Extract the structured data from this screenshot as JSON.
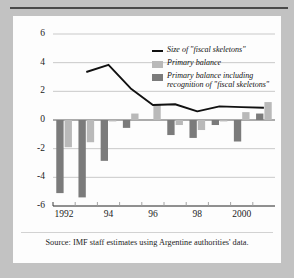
{
  "chart_data": {
    "type": "bar",
    "title": "",
    "subtitle": "",
    "xlabel": "",
    "ylabel": "",
    "ylim": [
      -6,
      6
    ],
    "yticks": [
      6,
      4,
      2,
      0,
      -2,
      -4,
      -6
    ],
    "ytick_labels": [
      "6",
      "4",
      "2",
      "0",
      "-2",
      "-4",
      "-6"
    ],
    "grid": true,
    "grid_axis": "y",
    "legend_position": "upper-right",
    "categories": [
      "1992",
      "1993",
      "1994",
      "1995",
      "1996",
      "1997",
      "1998",
      "1999",
      "2000",
      "2001"
    ],
    "xtick_labels": [
      "1992",
      "94",
      "96",
      "98",
      "2000"
    ],
    "xtick_categories": [
      "1992",
      "1994",
      "1996",
      "1998",
      "2000"
    ],
    "series": [
      {
        "name": "Primary balance",
        "type": "bar",
        "color": "#b9b9b9",
        "values": [
          -1.9,
          -1.55,
          -0.1,
          0.45,
          1.1,
          -0.35,
          -0.7,
          -0.1,
          0.55,
          1.25
        ]
      },
      {
        "name": "Primary balance including recognition of \"fiscal skeletons\"",
        "type": "bar",
        "color": "#7b7b7b",
        "values": [
          -5.1,
          -5.4,
          -2.85,
          -0.55,
          0.0,
          -1.05,
          -1.25,
          -0.35,
          -1.5,
          0.45
        ]
      },
      {
        "name": "Size of \"fiscal skeletons\"",
        "type": "line",
        "color": "#111111",
        "x": [
          "1993",
          "1994",
          "1995",
          "1996",
          "1997",
          "1998",
          "1999",
          "2000",
          "2001"
        ],
        "values": [
          3.35,
          3.85,
          2.2,
          1.05,
          1.1,
          0.6,
          0.95,
          0.9,
          0.85
        ]
      }
    ]
  },
  "legend": {
    "items": [
      {
        "label": "Size of \"fiscal skeletons\"",
        "marker": "line",
        "color": "#111111"
      },
      {
        "label": "Primary balance",
        "marker": "swatch",
        "color": "#b9b9b9"
      },
      {
        "label": "Primary balance including recognition of \"fiscal skeletons\"",
        "marker": "swatch",
        "color": "#7b7b7b"
      }
    ]
  },
  "footer": {
    "source": "Source: IMF staff estimates using Argentine authorities' data."
  }
}
